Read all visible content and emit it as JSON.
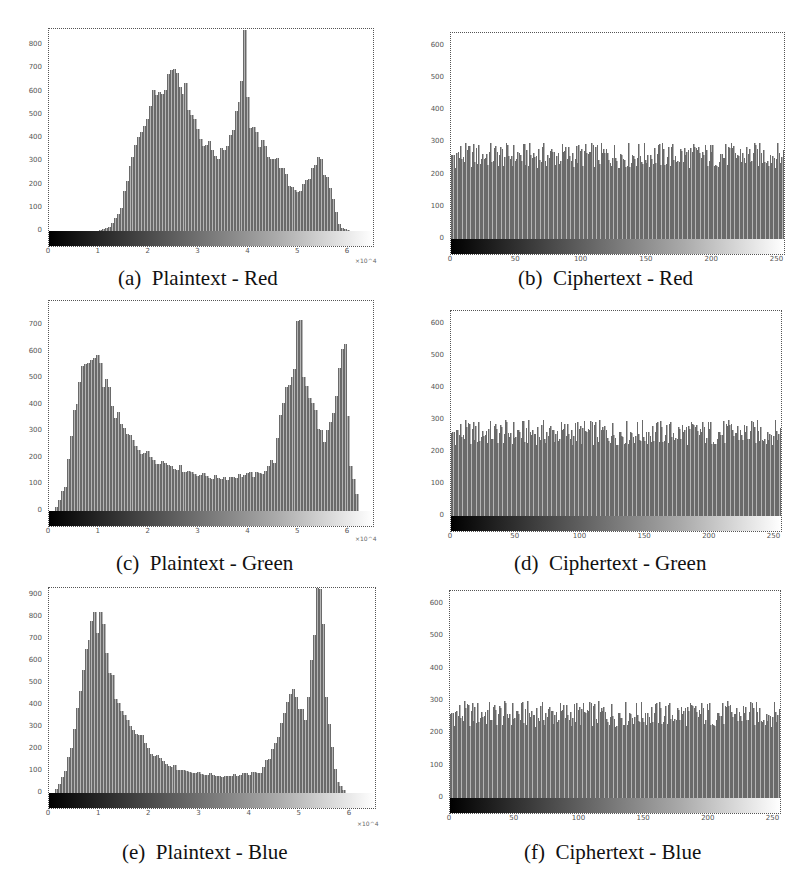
{
  "chart_data": [
    {
      "id": "a",
      "type": "bar",
      "title": "(a)  Plaintext - Red",
      "xlabel": "",
      "ylabel": "",
      "x_exponent_label": "×10^4",
      "xticks": [
        "0",
        "1",
        "2",
        "3",
        "4",
        "5",
        "6"
      ],
      "yticks": [
        "0",
        "100",
        "200",
        "300",
        "400",
        "500",
        "600",
        "700",
        "800"
      ],
      "ylim": [
        0,
        870
      ],
      "xlim": [
        0,
        6.5
      ],
      "x": [
        1.0,
        1.2,
        1.4,
        1.6,
        1.8,
        2.0,
        2.2,
        2.4,
        2.5,
        2.6,
        2.8,
        3.0,
        3.2,
        3.4,
        3.6,
        3.8,
        3.9,
        4.0,
        4.2,
        4.4,
        4.6,
        4.8,
        5.0,
        5.2,
        5.4,
        5.6,
        5.8,
        6.0
      ],
      "values": [
        5,
        20,
        90,
        280,
        430,
        560,
        640,
        700,
        740,
        680,
        560,
        420,
        370,
        330,
        420,
        600,
        850,
        460,
        390,
        340,
        300,
        200,
        175,
        240,
        330,
        200,
        20,
        0
      ]
    },
    {
      "id": "b",
      "type": "bar",
      "title": "(b)  Ciphertext - Red",
      "xlabel": "",
      "ylabel": "",
      "xticks": [
        "0",
        "50",
        "100",
        "150",
        "200",
        "250"
      ],
      "yticks": [
        "0",
        "100",
        "200",
        "300",
        "400",
        "500",
        "600"
      ],
      "ylim": [
        0,
        640
      ],
      "xlim": [
        0,
        255
      ],
      "description": "Near-uniform histogram across 256 bins, counts ~230-300",
      "mean_value": 256,
      "value_range": [
        220,
        300
      ]
    },
    {
      "id": "c",
      "type": "bar",
      "title": "(c)  Plaintext - Green",
      "xlabel": "",
      "ylabel": "",
      "x_exponent_label": "×10^4",
      "xticks": [
        "0",
        "1",
        "2",
        "3",
        "4",
        "5",
        "6"
      ],
      "yticks": [
        "0",
        "100",
        "200",
        "300",
        "400",
        "500",
        "600",
        "700"
      ],
      "ylim": [
        0,
        790
      ],
      "xlim": [
        0,
        6.5
      ],
      "x": [
        0.1,
        0.3,
        0.5,
        0.7,
        0.9,
        1.1,
        1.3,
        1.5,
        1.8,
        2.1,
        2.4,
        2.7,
        3.0,
        3.3,
        3.6,
        3.9,
        4.2,
        4.5,
        4.7,
        4.9,
        5.0,
        5.1,
        5.3,
        5.5,
        5.7,
        5.9,
        6.0,
        6.2
      ],
      "values": [
        10,
        100,
        420,
        560,
        580,
        500,
        380,
        300,
        240,
        200,
        180,
        160,
        140,
        130,
        130,
        140,
        140,
        200,
        470,
        560,
        790,
        480,
        390,
        260,
        380,
        700,
        200,
        10
      ]
    },
    {
      "id": "d",
      "type": "bar",
      "title": "(d)  Ciphertext - Green",
      "xlabel": "",
      "ylabel": "",
      "xticks": [
        "0",
        "50",
        "100",
        "150",
        "200",
        "250"
      ],
      "yticks": [
        "0",
        "100",
        "200",
        "300",
        "400",
        "500",
        "600"
      ],
      "ylim": [
        0,
        640
      ],
      "xlim": [
        0,
        255
      ],
      "description": "Near-uniform histogram across 256 bins, counts ~230-300",
      "mean_value": 256,
      "value_range": [
        220,
        300
      ]
    },
    {
      "id": "e",
      "type": "bar",
      "title": "(e)  Plaintext - Blue",
      "xlabel": "",
      "ylabel": "",
      "x_exponent_label": "×10^4",
      "xticks": [
        "0",
        "1",
        "2",
        "3",
        "4",
        "5",
        "6"
      ],
      "yticks": [
        "0",
        "100",
        "200",
        "300",
        "400",
        "500",
        "600",
        "700",
        "800",
        "900"
      ],
      "ylim": [
        0,
        930
      ],
      "xlim": [
        0,
        6.5
      ],
      "x": [
        0.1,
        0.3,
        0.5,
        0.7,
        0.9,
        1.0,
        1.1,
        1.3,
        1.5,
        1.7,
        2.0,
        2.3,
        2.6,
        3.0,
        3.4,
        3.8,
        4.2,
        4.5,
        4.7,
        4.8,
        5.0,
        5.1,
        5.2,
        5.3,
        5.4,
        5.5,
        5.7,
        5.9
      ],
      "values": [
        10,
        100,
        320,
        650,
        800,
        810,
        700,
        430,
        340,
        300,
        200,
        140,
        110,
        90,
        80,
        85,
        100,
        220,
        420,
        490,
        390,
        330,
        600,
        930,
        930,
        400,
        60,
        0
      ]
    },
    {
      "id": "f",
      "type": "bar",
      "title": "(f)  Ciphertext - Blue",
      "xlabel": "",
      "ylabel": "",
      "xticks": [
        "0",
        "50",
        "100",
        "150",
        "200",
        "250"
      ],
      "yticks": [
        "0",
        "100",
        "200",
        "300",
        "400",
        "500",
        "600"
      ],
      "ylim": [
        0,
        640
      ],
      "xlim": [
        0,
        255
      ],
      "description": "Near-uniform histogram across 256 bins, counts ~230-300",
      "mean_value": 256,
      "value_range": [
        220,
        300
      ]
    }
  ],
  "captions": {
    "a": "(a)  Plaintext - Red",
    "b": "(b)  Ciphertext - Red",
    "c": "(c)  Plaintext - Green",
    "d": "(d)  Ciphertext - Green",
    "e": "(e)  Plaintext - Blue",
    "f": "(f)  Ciphertext - Blue"
  }
}
